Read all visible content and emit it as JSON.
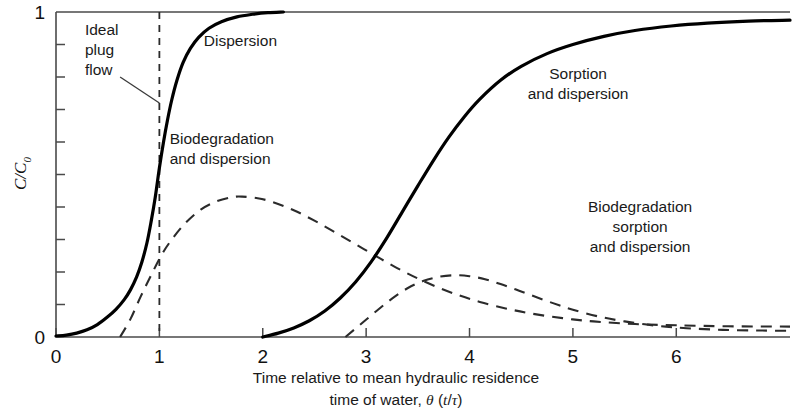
{
  "chart_data": {
    "type": "line",
    "title": "",
    "xlabel": "Time relative to mean hydraulic residence time of water, θ (t/τ)",
    "xlabel_line1": "Time relative to mean hydraulic residence",
    "xlabel_line2": "time of water, θ (t/τ)",
    "ylabel": "C/C0",
    "ylabel_main": "C/C",
    "ylabel_sub": "0",
    "xlim": [
      0,
      7.1
    ],
    "ylim": [
      0,
      1
    ],
    "x_ticks": [
      0,
      1,
      2,
      3,
      4,
      5,
      6
    ],
    "x_tick_labels": [
      "0",
      "1",
      "2",
      "3",
      "4",
      "5",
      "6"
    ],
    "y_ticks": [
      0,
      1
    ],
    "y_tick_labels": [
      "0",
      "1"
    ],
    "y_minor_tick_count": 9,
    "grid": false,
    "legend": "none",
    "series": [
      {
        "name": "Dispersion",
        "style": "solid",
        "color": "#000000",
        "label": "Dispersion",
        "label_x": 1.43,
        "label_y": 0.895,
        "x": [
          0.0,
          0.1,
          0.2,
          0.3,
          0.4,
          0.5,
          0.58,
          0.66,
          0.72,
          0.78,
          0.83,
          0.88,
          0.92,
          0.96,
          1.0,
          1.04,
          1.08,
          1.12,
          1.17,
          1.23,
          1.3,
          1.38,
          1.48,
          1.6,
          1.75,
          1.9,
          2.05,
          2.2
        ],
        "y": [
          0.003,
          0.006,
          0.012,
          0.022,
          0.038,
          0.062,
          0.085,
          0.115,
          0.145,
          0.185,
          0.23,
          0.29,
          0.355,
          0.43,
          0.52,
          0.6,
          0.67,
          0.73,
          0.79,
          0.845,
          0.888,
          0.922,
          0.95,
          0.97,
          0.985,
          0.993,
          0.998,
          1.0
        ]
      },
      {
        "name": "Biodegradation and dispersion",
        "style": "dashed",
        "color": "#2b2b2b",
        "label_line1": "Biodegradation",
        "label_line2": "and dispersion",
        "label_x": 1.1,
        "label_y": 0.595,
        "x": [
          0.62,
          0.72,
          0.82,
          0.92,
          1.02,
          1.12,
          1.25,
          1.4,
          1.55,
          1.7,
          1.8,
          1.95,
          2.1,
          2.3,
          2.5,
          2.7,
          2.9,
          3.1,
          3.3,
          3.5,
          3.7,
          3.9,
          4.1,
          4.35,
          4.6,
          4.9,
          5.2,
          5.6,
          6.0,
          6.5,
          7.1
        ],
        "y": [
          0.0,
          0.055,
          0.125,
          0.19,
          0.252,
          0.3,
          0.35,
          0.392,
          0.417,
          0.43,
          0.432,
          0.427,
          0.415,
          0.39,
          0.358,
          0.322,
          0.285,
          0.248,
          0.212,
          0.18,
          0.152,
          0.128,
          0.108,
          0.088,
          0.072,
          0.058,
          0.048,
          0.04,
          0.036,
          0.033,
          0.032
        ]
      },
      {
        "name": "Sorption and dispersion",
        "style": "solid",
        "color": "#000000",
        "label_line1": "Sorption",
        "label_line2": "and dispersion",
        "label_x": 5.05,
        "label_y": 0.795,
        "x": [
          2.0,
          2.15,
          2.3,
          2.45,
          2.6,
          2.75,
          2.9,
          3.05,
          3.2,
          3.35,
          3.5,
          3.65,
          3.8,
          3.95,
          4.1,
          4.3,
          4.5,
          4.75,
          5.0,
          5.3,
          5.6,
          5.95,
          6.3,
          6.7,
          7.1
        ],
        "y": [
          0.0,
          0.012,
          0.028,
          0.05,
          0.08,
          0.12,
          0.17,
          0.232,
          0.305,
          0.385,
          0.465,
          0.543,
          0.615,
          0.678,
          0.732,
          0.79,
          0.833,
          0.872,
          0.9,
          0.925,
          0.943,
          0.957,
          0.966,
          0.972,
          0.975
        ]
      },
      {
        "name": "Biodegradation sorption and dispersion",
        "style": "dashed",
        "color": "#2b2b2b",
        "label_line1": "Biodegradation",
        "label_line2": "sorption",
        "label_line3": "and dispersion",
        "label_x": 5.65,
        "label_y": 0.385,
        "x": [
          2.8,
          2.95,
          3.1,
          3.25,
          3.4,
          3.55,
          3.7,
          3.85,
          4.0,
          4.15,
          4.3,
          4.45,
          4.6,
          4.8,
          5.0,
          5.25,
          5.5,
          5.8,
          6.1,
          6.45,
          6.8,
          7.1
        ],
        "y": [
          0.0,
          0.04,
          0.08,
          0.118,
          0.15,
          0.172,
          0.185,
          0.19,
          0.187,
          0.178,
          0.163,
          0.146,
          0.128,
          0.105,
          0.084,
          0.063,
          0.048,
          0.035,
          0.027,
          0.022,
          0.02,
          0.019
        ]
      }
    ],
    "annotations": [
      {
        "name": "ideal-plug-flow",
        "line1": "Ideal",
        "line2": "plug",
        "line3": "flow",
        "text_x": 0.28,
        "text_y": 0.93,
        "marker_type": "vertical-dashed-line",
        "marker_x": 1.0,
        "leader_from_x": 0.62,
        "leader_from_y": 0.8,
        "leader_to_x": 1.0,
        "leader_to_y": 0.72
      }
    ]
  }
}
